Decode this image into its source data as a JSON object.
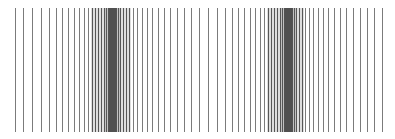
{
  "pattern": {
    "type": "vertical-line-spectrum",
    "line_color": "#5a5a5a",
    "cluster_color": "#444444",
    "groups": [
      {
        "name": "left-group",
        "positions": [
          0.038,
          0.058,
          0.081,
          0.104,
          0.124,
          0.142,
          0.157,
          0.172,
          0.187,
          0.2,
          0.213,
          0.223,
          0.233,
          0.241,
          0.248,
          0.256,
          0.263,
          0.268,
          0.273,
          0.276,
          0.278,
          0.281,
          0.284,
          0.286,
          0.289,
          0.291,
          0.294,
          0.299,
          0.304,
          0.311,
          0.319,
          0.327,
          0.337,
          0.347,
          0.359,
          0.372,
          0.385,
          0.4,
          0.415,
          0.43,
          0.448,
          0.466
        ]
      },
      {
        "name": "right-group",
        "positions": [
          0.484,
          0.504,
          0.527,
          0.549,
          0.57,
          0.587,
          0.603,
          0.618,
          0.633,
          0.646,
          0.658,
          0.668,
          0.678,
          0.686,
          0.694,
          0.701,
          0.709,
          0.714,
          0.719,
          0.722,
          0.724,
          0.727,
          0.73,
          0.732,
          0.735,
          0.737,
          0.739,
          0.744,
          0.749,
          0.757,
          0.764,
          0.773,
          0.782,
          0.792,
          0.805,
          0.818,
          0.83,
          0.846,
          0.861,
          0.876,
          0.894,
          0.911,
          0.929,
          0.947,
          0.967
        ]
      }
    ]
  }
}
